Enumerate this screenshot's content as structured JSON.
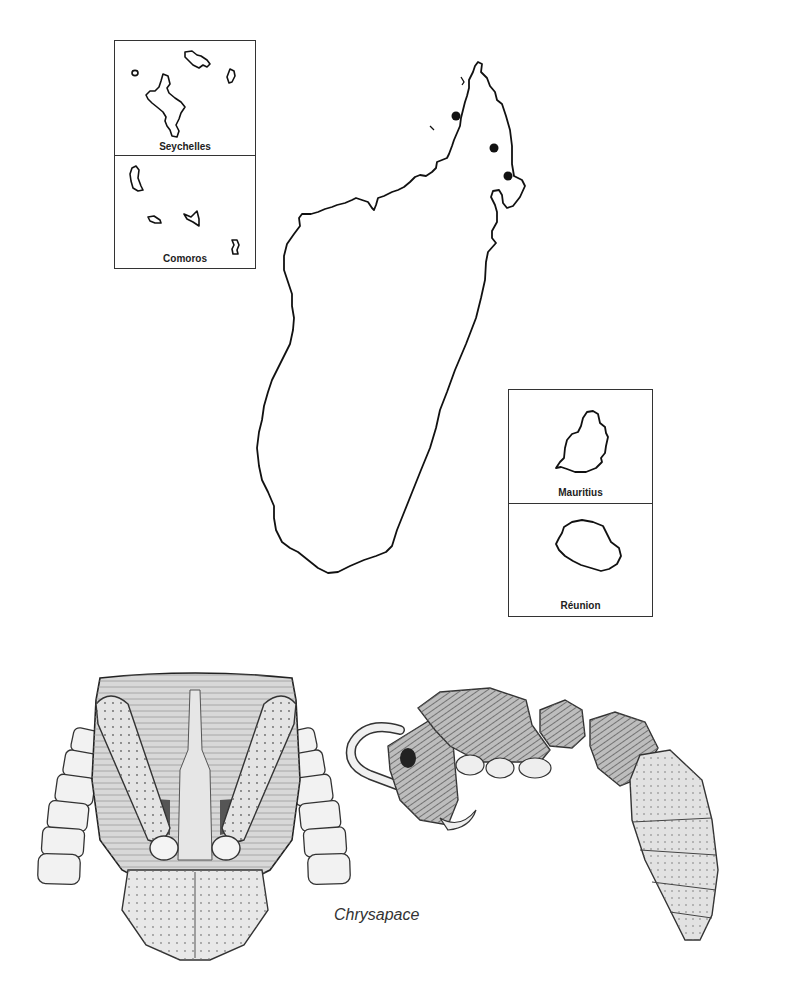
{
  "figure": {
    "main_map": {
      "name": "Madagascar",
      "records_count": 3,
      "record_points": [
        {
          "x": 456,
          "y": 116
        },
        {
          "x": 494,
          "y": 148
        },
        {
          "x": 508,
          "y": 176
        }
      ],
      "point_color": "#111111",
      "outline_color": "#111111"
    },
    "insets": [
      {
        "label": "Seychelles"
      },
      {
        "label": "Comoros"
      },
      {
        "label": "Mauritius"
      },
      {
        "label": "Réunion"
      }
    ],
    "genus_caption": "Chrysapace",
    "illustrations": [
      {
        "view": "head-frontal"
      },
      {
        "view": "body-lateral"
      }
    ]
  }
}
